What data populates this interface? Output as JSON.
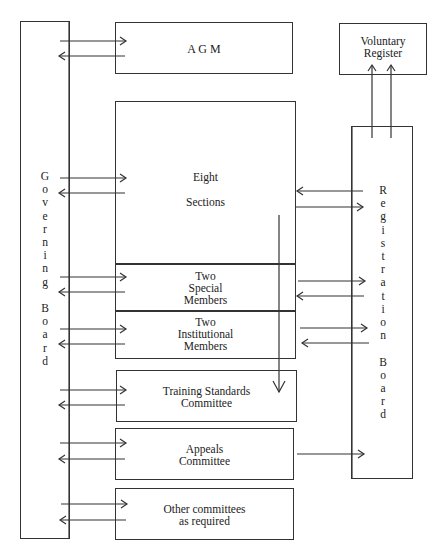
{
  "diagram": {
    "governing_board": {
      "label": "G\no\nv\ne\nr\nn\ni\nn\ng\n\nB\no\na\nr\nd",
      "text": "Governing Board"
    },
    "registration_board": {
      "label": "R\ne\ng\ni\ns\nt\nr\na\nt\ni\no\nn\n\nB\no\na\nr\nd",
      "text": "Registration Board"
    },
    "voluntary_register": {
      "label": "Voluntary\nRegister"
    },
    "agm": {
      "label": "A G M"
    },
    "eight_sections": {
      "line1": "Eight",
      "line2": "Sections"
    },
    "special_members": {
      "label": "Two\nSpecial\nMembers"
    },
    "institutional_members": {
      "label": "Two\nInstitutional\nMembers"
    },
    "training_standards": {
      "label": "Training Standards\nCommittee"
    },
    "appeals": {
      "label": "Appeals\nCommittee"
    },
    "other_committees": {
      "label": "Other committees\nas required"
    },
    "connections": [
      {
        "from": "Governing Board",
        "to": "AGM",
        "bidirectional": true
      },
      {
        "from": "Governing Board",
        "to": "Eight Sections",
        "bidirectional": true
      },
      {
        "from": "Governing Board",
        "to": "Two Special Members",
        "bidirectional": true
      },
      {
        "from": "Governing Board",
        "to": "Two Institutional Members",
        "bidirectional": true
      },
      {
        "from": "Governing Board",
        "to": "Training Standards Committee",
        "bidirectional": true
      },
      {
        "from": "Governing Board",
        "to": "Appeals Committee",
        "bidirectional": true
      },
      {
        "from": "Governing Board",
        "to": "Other committees as required",
        "bidirectional": true
      },
      {
        "from": "Registration Board",
        "to": "Eight Sections",
        "bidirectional": true
      },
      {
        "from": "Registration Board",
        "to": "Two Special Members",
        "bidirectional": true
      },
      {
        "from": "Registration Board",
        "to": "Two Institutional Members",
        "bidirectional": true
      },
      {
        "from": "Appeals Committee",
        "to": "Registration Board",
        "bidirectional": false
      },
      {
        "from": "Eight Sections",
        "to": "Training Standards Committee",
        "bidirectional": false
      },
      {
        "from": "Registration Board",
        "to": "Voluntary Register",
        "bidirectional": false,
        "count": 2
      }
    ]
  }
}
